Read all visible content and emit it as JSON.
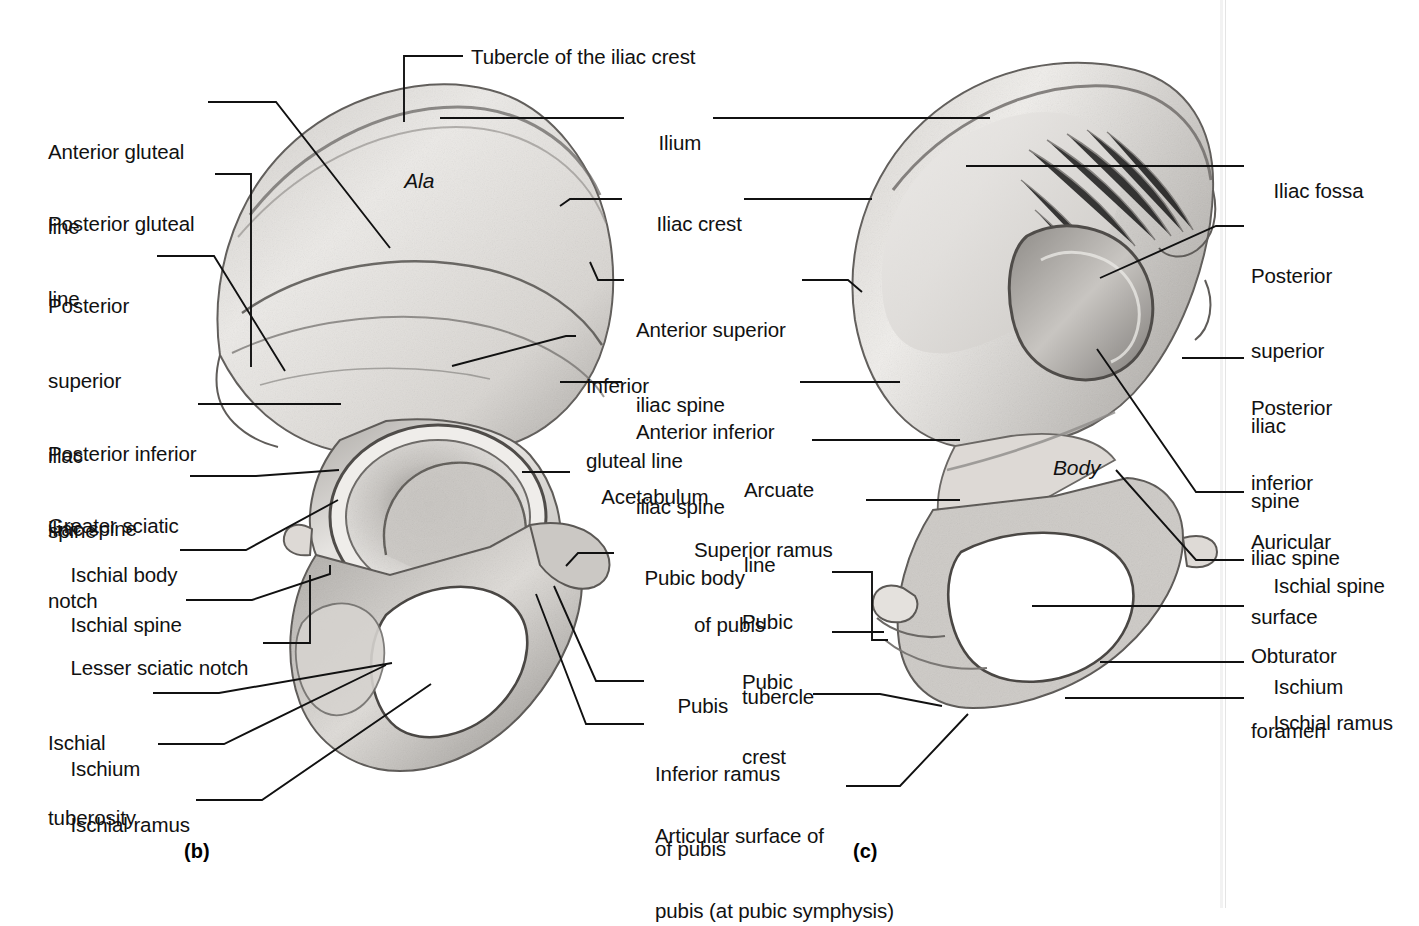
{
  "figure": {
    "title_text": null,
    "panels": [
      {
        "id": "b",
        "caption": "(b)",
        "view": "lateral-external-surface"
      },
      {
        "id": "c",
        "caption": "(c)",
        "view": "medial-internal-surface"
      }
    ],
    "inline_labels": [
      {
        "name": "ala",
        "text": "Ala",
        "style": "italic",
        "panel": "b"
      },
      {
        "name": "body",
        "text": "Body",
        "style": "italic",
        "panel": "c"
      }
    ]
  },
  "labels": {
    "top_center": {
      "tubercle_of_iliac_crest": "Tubercle of the iliac crest"
    },
    "left_column": [
      {
        "key": "anterior-gluteal-line",
        "lines": [
          "Anterior gluteal",
          "line"
        ]
      },
      {
        "key": "posterior-gluteal-line",
        "lines": [
          "Posterior gluteal",
          "line"
        ]
      },
      {
        "key": "posterior-superior-iliac-spine",
        "lines": [
          "Posterior",
          "superior",
          "iliac",
          "spine"
        ]
      },
      {
        "key": "posterior-inferior-iliac-spine",
        "lines": [
          "Posterior inferior",
          "iliac spine"
        ]
      },
      {
        "key": "greater-sciatic-notch",
        "lines": [
          "Greater sciatic",
          "notch"
        ]
      },
      {
        "key": "ischial-body",
        "lines": [
          "Ischial body"
        ]
      },
      {
        "key": "ischial-spine",
        "lines": [
          "Ischial spine"
        ]
      },
      {
        "key": "lesser-sciatic-notch",
        "lines": [
          "Lesser sciatic notch"
        ]
      },
      {
        "key": "ischial-tuberosity",
        "lines": [
          "Ischial",
          "tuberosity"
        ]
      },
      {
        "key": "ischium",
        "lines": [
          "Ischium"
        ]
      },
      {
        "key": "ischial-ramus",
        "lines": [
          "Ischial ramus"
        ]
      }
    ],
    "center_column": [
      {
        "key": "ilium",
        "lines": [
          "Ilium"
        ]
      },
      {
        "key": "iliac-crest",
        "lines": [
          "Iliac crest"
        ]
      },
      {
        "key": "anterior-superior-iliac-spine",
        "lines": [
          "Anterior superior",
          "iliac spine"
        ]
      },
      {
        "key": "inferior-gluteal-line",
        "lines": [
          "Inferior",
          "gluteal line"
        ]
      },
      {
        "key": "anterior-inferior-iliac-spine",
        "lines": [
          "Anterior inferior",
          "iliac spine"
        ]
      },
      {
        "key": "acetabulum",
        "lines": [
          "Acetabulum"
        ]
      },
      {
        "key": "pubic-body",
        "lines": [
          "Pubic body"
        ]
      },
      {
        "key": "pubis",
        "lines": [
          "Pubis"
        ]
      },
      {
        "key": "inferior-ramus-of-pubis",
        "lines": [
          "Inferior ramus",
          "of pubis"
        ]
      }
    ],
    "center_right_column": [
      {
        "key": "arcuate-line",
        "lines": [
          "Arcuate",
          "line"
        ]
      },
      {
        "key": "superior-ramus-of-pubis",
        "lines": [
          "Superior ramus",
          "of pubis"
        ]
      },
      {
        "key": "pubic-tubercle",
        "lines": [
          "Pubic",
          "tubercle"
        ]
      },
      {
        "key": "pubic-crest",
        "lines": [
          "Pubic",
          "crest"
        ]
      },
      {
        "key": "articular-surface-of-pubis",
        "lines": [
          "Articular surface of",
          "pubis (at pubic symphysis)"
        ]
      }
    ],
    "right_column": [
      {
        "key": "iliac-fossa",
        "lines": [
          "Iliac fossa"
        ]
      },
      {
        "key": "posterior-superior-iliac-spine-c",
        "lines": [
          "Posterior",
          "superior",
          "iliac",
          "spine"
        ]
      },
      {
        "key": "posterior-inferior-iliac-spine-c",
        "lines": [
          "Posterior",
          "inferior",
          "iliac spine"
        ]
      },
      {
        "key": "auricular-surface",
        "lines": [
          "Auricular",
          "surface"
        ]
      },
      {
        "key": "ischial-spine-c",
        "lines": [
          "Ischial spine"
        ]
      },
      {
        "key": "obturator-foramen",
        "lines": [
          "Obturator",
          "foramen"
        ]
      },
      {
        "key": "ischium-c",
        "lines": [
          "Ischium"
        ]
      },
      {
        "key": "ischial-ramus-c",
        "lines": [
          "Ischial ramus"
        ]
      }
    ]
  },
  "colors": {
    "background": "#ffffff",
    "text": "#111111",
    "leader_line": "#111111",
    "bone_light": "#e8e6e3",
    "bone_mid": "#b9b6b2",
    "bone_dark": "#6f6c69",
    "page_edge": "#e4e4e4"
  }
}
